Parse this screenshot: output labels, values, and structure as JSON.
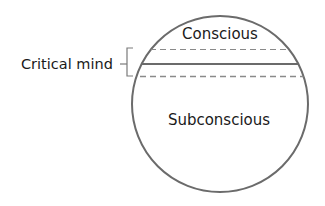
{
  "diagram": {
    "labels": {
      "conscious": "Conscious",
      "critical_mind": "Critical mind",
      "subconscious": "Subconscious"
    },
    "colors": {
      "stroke": "#6b6b6b",
      "dashed": "#8a8a8a",
      "text": "#1a1a1a",
      "background": "#ffffff"
    }
  }
}
